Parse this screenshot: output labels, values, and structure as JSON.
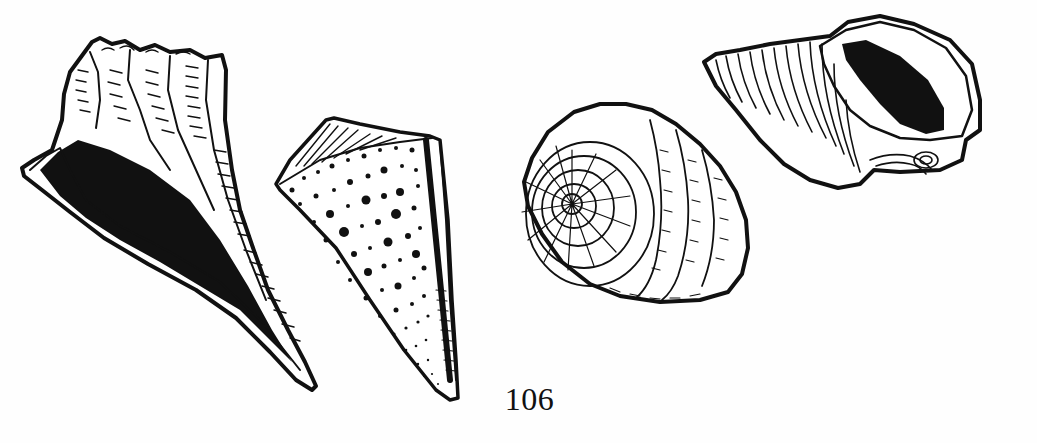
{
  "page": {
    "number": "106",
    "background": "#ffffff",
    "ink": "#111111"
  },
  "illustrations": [
    {
      "name": "lightning-whelk-shell",
      "style": "pen-and-ink",
      "position": "left"
    },
    {
      "name": "spotted-cone-shell",
      "style": "pen-and-ink",
      "position": "center-left"
    },
    {
      "name": "top-shell-apex-view",
      "style": "pen-and-ink",
      "position": "center-right"
    },
    {
      "name": "conch-shell-with-aperture",
      "style": "pen-and-ink",
      "position": "right"
    }
  ]
}
